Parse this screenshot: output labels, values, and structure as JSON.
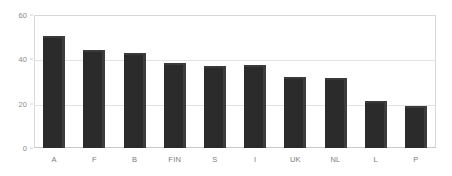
{
  "chart_data": {
    "type": "bar",
    "title": "",
    "subtitle": "",
    "xlabel": "",
    "ylabel": "",
    "categories": [
      "A",
      "F",
      "B",
      "FIN",
      "S",
      "I",
      "UK",
      "NL",
      "L",
      "P"
    ],
    "values": [
      50.5,
      44,
      43,
      38.5,
      37,
      37.5,
      32,
      31.5,
      21,
      19
    ],
    "series": [
      {
        "name": "",
        "values": [
          50.5,
          44,
          43,
          38.5,
          37,
          37.5,
          32,
          31.5,
          21,
          19
        ]
      }
    ],
    "ylim": [
      0,
      60
    ],
    "ytick_labels": [
      "0",
      "20",
      "40",
      "60"
    ],
    "ytick_values": [
      0,
      20,
      40,
      60
    ],
    "grid": true,
    "legend": false,
    "legend_position": "none",
    "bar_color": "#2b2b2b",
    "bar_edge_color": "#3d3d3d",
    "gridline_color": "#e2e2e2",
    "plot_border_color": "#d8d8d8",
    "axis_label_color": "#8a8a8a",
    "background_color": "#ffffff"
  }
}
